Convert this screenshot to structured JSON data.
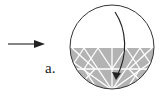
{
  "figure": {
    "label": "a.",
    "elements": {
      "incoming_arrow": "right-pointing arrow",
      "circle": "circle, lower portion shaded gray with white triangular mesh",
      "curved_arrow": "curved arrow from top of circle down into shaded region"
    },
    "colors": {
      "stroke": "#222222",
      "shade": "#b3b3b3",
      "mesh": "#ffffff"
    }
  }
}
